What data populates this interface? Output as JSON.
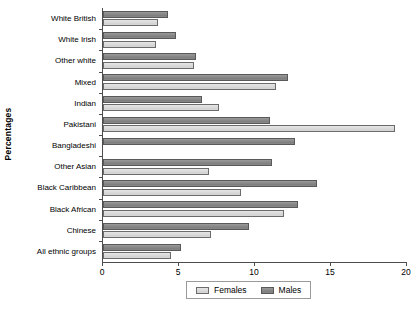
{
  "chart_data": {
    "type": "bar",
    "orientation": "horizontal",
    "title": "",
    "xlabel": "",
    "ylabel": "Percentages",
    "xlim": [
      0,
      20
    ],
    "xticks": [
      0,
      5,
      10,
      15,
      20
    ],
    "grid": false,
    "legend_position": "bottom-center",
    "categories": [
      "White British",
      "White Irish",
      "Other white",
      "Mixed",
      "Indian",
      "Pakistani",
      "Bangladeshi",
      "Other Asian",
      "Black Caribbean",
      "Black African",
      "Chinese",
      "All ethnic groups"
    ],
    "series": [
      {
        "name": "Females",
        "color": "#dcdcdc",
        "values": [
          3.6,
          3.5,
          6.0,
          11.4,
          7.6,
          19.2,
          0.0,
          7.0,
          9.1,
          11.9,
          7.1,
          4.5
        ]
      },
      {
        "name": "Males",
        "color": "#8a8a8a",
        "values": [
          4.3,
          4.8,
          6.1,
          12.2,
          6.5,
          11.0,
          12.6,
          11.1,
          14.1,
          12.8,
          9.6,
          5.1
        ]
      }
    ]
  },
  "axis": {
    "y_title": "Percentages"
  }
}
